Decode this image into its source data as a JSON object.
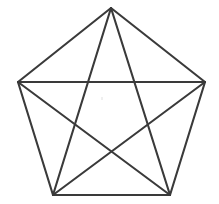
{
  "figure": {
    "name": "pentagon-with-all-diagonals",
    "background_color": "#ffffff",
    "stroke_color": "#3a3a3a",
    "stroke_width": 2.1,
    "canvas": {
      "width": 219,
      "height": 204
    },
    "vertex_count": 5,
    "edge_count": 5,
    "diagonal_count": 5,
    "vertices": [
      {
        "label": "A",
        "role": "apex-top",
        "x": 111,
        "y": 8
      },
      {
        "label": "B",
        "role": "right",
        "x": 205,
        "y": 82
      },
      {
        "label": "C",
        "role": "bottom-right",
        "x": 170,
        "y": 195
      },
      {
        "label": "D",
        "role": "bottom-left",
        "x": 53,
        "y": 195
      },
      {
        "label": "E",
        "role": "left",
        "x": 18,
        "y": 82
      }
    ],
    "edges": [
      {
        "name": "edge-A-B",
        "from": 0,
        "to": 1
      },
      {
        "name": "edge-B-C",
        "from": 1,
        "to": 2
      },
      {
        "name": "edge-C-D",
        "from": 2,
        "to": 3
      },
      {
        "name": "edge-D-E",
        "from": 3,
        "to": 4
      },
      {
        "name": "edge-E-A",
        "from": 4,
        "to": 0
      }
    ],
    "diagonals": [
      {
        "name": "diagonal-A-C",
        "from": 0,
        "to": 2
      },
      {
        "name": "diagonal-A-D",
        "from": 0,
        "to": 3
      },
      {
        "name": "diagonal-B-D",
        "from": 1,
        "to": 3
      },
      {
        "name": "diagonal-B-E",
        "from": 1,
        "to": 4
      },
      {
        "name": "diagonal-C-E",
        "from": 2,
        "to": 4
      }
    ],
    "artifact": {
      "name": "center-speck",
      "x": 101,
      "y": 97
    }
  }
}
